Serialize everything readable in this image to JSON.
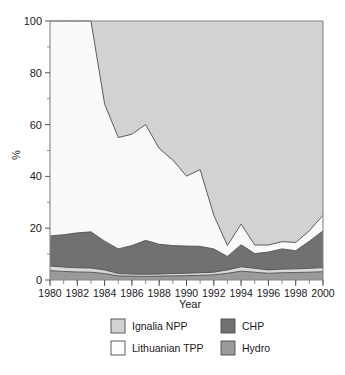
{
  "chart_data": {
    "type": "area",
    "stacked": true,
    "title": "",
    "xlabel": "Year",
    "ylabel": "%",
    "xlim": [
      1980,
      2000
    ],
    "ylim": [
      0,
      100
    ],
    "grid": false,
    "legend_position": "bottom",
    "x": [
      1980,
      1981,
      1982,
      1983,
      1984,
      1985,
      1986,
      1987,
      1988,
      1989,
      1990,
      1991,
      1992,
      1993,
      1994,
      1995,
      1996,
      1997,
      1998,
      1999,
      2000
    ],
    "xticks": [
      1980,
      1982,
      1984,
      1986,
      1988,
      1990,
      1992,
      1994,
      1996,
      1998,
      2000
    ],
    "xtick_labels": [
      "1980",
      "1982",
      "1984",
      "1986",
      "1988",
      "1990",
      "1992",
      "1994",
      "1996",
      "1998",
      "2000"
    ],
    "yticks": [
      0,
      20,
      40,
      60,
      80,
      100
    ],
    "ytick_labels": [
      "0",
      "20",
      "40",
      "60",
      "80",
      "100"
    ],
    "yminor_ticks": [
      10,
      30,
      50,
      70,
      90
    ],
    "series": [
      {
        "name": "Hydro",
        "color": "#9a9a9a",
        "order": 1,
        "values": [
          3.6,
          3.3,
          3.1,
          3.0,
          2.5,
          1.6,
          1.5,
          1.4,
          1.5,
          1.6,
          1.7,
          1.8,
          2.0,
          2.6,
          3.4,
          3.0,
          2.6,
          2.8,
          2.9,
          3.0,
          3.2
        ]
      },
      {
        "name": "Ignalia NPP",
        "color": "#d9d9d9",
        "order": 2,
        "values": [
          1.8,
          1.7,
          1.6,
          1.6,
          1.4,
          0.9,
          0.8,
          0.8,
          0.8,
          0.9,
          0.9,
          1.0,
          1.0,
          1.3,
          1.7,
          1.5,
          1.3,
          1.4,
          1.4,
          1.5,
          1.6
        ]
      },
      {
        "name": "CHP",
        "color": "#717171",
        "order": 3,
        "values": [
          11.6,
          12.5,
          13.5,
          14.0,
          11.1,
          9.5,
          11.0,
          13.1,
          11.5,
          10.8,
          10.5,
          10.2,
          9.0,
          5.2,
          8.5,
          5.7,
          6.9,
          7.8,
          7.0,
          10.5,
          14.2
        ]
      },
      {
        "name": "Lithuanian TPP",
        "color": "#fafafa",
        "order": 4,
        "values": [
          83.0,
          82.5,
          81.8,
          81.4,
          53.0,
          43.0,
          43.0,
          44.7,
          37.0,
          33.0,
          27.0,
          29.6,
          13.0,
          4.2,
          8.0,
          3.3,
          2.7,
          2.8,
          3.2,
          4.0,
          6.0
        ]
      },
      {
        "name": "Ignalia NPP (top)",
        "color": "#d2d2d2",
        "order": 5,
        "values": [
          0.0,
          0.0,
          0.0,
          0.0,
          32.0,
          45.0,
          43.7,
          40.0,
          49.2,
          53.7,
          59.9,
          57.4,
          75.0,
          86.7,
          78.4,
          86.5,
          86.5,
          85.2,
          85.5,
          81.0,
          75.0
        ]
      }
    ],
    "boundaries": {
      "hydro_top": [
        3.6,
        3.3,
        3.1,
        3.0,
        2.5,
        1.6,
        1.5,
        1.4,
        1.5,
        1.6,
        1.7,
        1.8,
        2.0,
        2.6,
        3.4,
        3.0,
        2.6,
        2.8,
        2.9,
        3.0,
        3.2
      ],
      "ignalina_bottom_top": [
        5.4,
        5.0,
        4.7,
        4.6,
        3.9,
        2.5,
        2.3,
        2.2,
        2.3,
        2.5,
        2.6,
        2.8,
        3.0,
        3.9,
        5.1,
        4.5,
        3.9,
        4.2,
        4.3,
        4.5,
        4.8
      ],
      "chp_top": [
        17.0,
        17.5,
        18.2,
        18.6,
        15.0,
        12.0,
        13.3,
        15.3,
        13.8,
        13.3,
        13.1,
        13.0,
        12.0,
        9.1,
        13.6,
        10.2,
        10.8,
        12.0,
        11.3,
        15.0,
        19.0
      ],
      "tpp_top": [
        100.0,
        100.0,
        100.0,
        100.0,
        68.0,
        55.0,
        56.3,
        60.0,
        50.8,
        46.3,
        40.1,
        42.6,
        25.0,
        13.3,
        21.6,
        13.5,
        13.5,
        14.8,
        14.5,
        19.0,
        25.0
      ]
    }
  },
  "legend": {
    "items": [
      {
        "label": "Ignalia NPP",
        "color": "#d2d2d2"
      },
      {
        "label": "CHP",
        "color": "#717171"
      },
      {
        "label": "Lithuanian TPP",
        "color": "#fdfdfd"
      },
      {
        "label": "Hydro",
        "color": "#9a9a9a"
      }
    ]
  },
  "axes": {
    "ylabel": "%",
    "xlabel": "Year"
  }
}
